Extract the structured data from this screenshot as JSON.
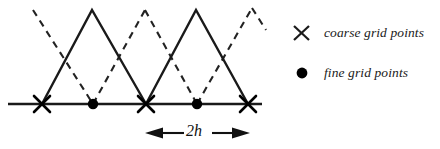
{
  "figure": {
    "colors": {
      "line": "#1a1a1a",
      "dashed": "#2a2a2a",
      "marker": "#000000",
      "text": "#111111",
      "background": "#ffffff"
    }
  },
  "axis": {
    "baseline_y": 104,
    "x_start": 8,
    "x_end": 262
  },
  "coarse_grid": {
    "marker": "x-marker",
    "points_x": [
      42,
      146,
      248
    ],
    "points_y": 104
  },
  "fine_grid": {
    "marker": "dot-marker",
    "points_x": [
      93,
      197
    ],
    "points_y": 104
  },
  "coarse_hats": {
    "style": "solid",
    "peaks": [
      {
        "x": 92,
        "y": 10
      },
      {
        "x": 196,
        "y": 10
      }
    ],
    "bases": [
      {
        "left_x": 42,
        "right_x": 146
      },
      {
        "left_x": 146,
        "right_x": 248
      }
    ]
  },
  "fine_hats": {
    "style": "dashed",
    "peaks": [
      {
        "x": 33,
        "y": 10
      },
      {
        "x": 145,
        "y": 10
      },
      {
        "x": 252,
        "y": 8
      }
    ],
    "valleys": [
      {
        "x": 93,
        "y": 104
      },
      {
        "x": 197,
        "y": 104
      }
    ]
  },
  "spacing_annotation": {
    "label": "2h",
    "arrow_left_x": 147,
    "arrow_right_x": 248,
    "arrow_y": 133,
    "double_headed": true
  },
  "legend": {
    "items": [
      {
        "marker": "x-marker",
        "label": "coarse grid points",
        "marker_x": 301,
        "marker_y": 33
      },
      {
        "marker": "dot-marker",
        "label": "fine grid points",
        "marker_x": 303,
        "marker_y": 73
      }
    ]
  }
}
